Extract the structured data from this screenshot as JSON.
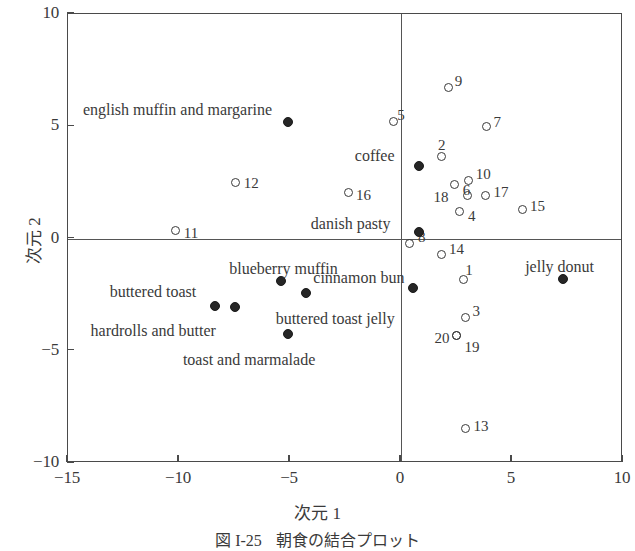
{
  "figure": {
    "caption_number": "図 I-25",
    "caption_text": "朝食の結合プロット"
  },
  "chart_data": {
    "type": "scatter",
    "title": "朝食の結合プロット",
    "xlabel": "次元 1",
    "ylabel": "次元 2",
    "xlim": [
      -15,
      10
    ],
    "ylim": [
      -10,
      10
    ],
    "xticks": [
      "-15",
      "-10",
      "-5",
      "0",
      "5",
      "10"
    ],
    "xtick_values": [
      -15,
      -10,
      -5,
      0,
      5,
      10
    ],
    "yticks": [
      "10",
      "5",
      "0",
      "-5",
      "-10"
    ],
    "ytick_values": [
      10,
      5,
      0,
      -5,
      -10
    ],
    "grid": false,
    "legend": "none",
    "series": [
      {
        "name": "attributes (open circles, numbered)",
        "marker": "open-circle",
        "points": [
          {
            "label": "9",
            "x": 2.2,
            "y": 6.7,
            "lx": 6,
            "ly": -13
          },
          {
            "label": "5",
            "x": -0.3,
            "y": 5.15,
            "lx": 4,
            "ly": -14
          },
          {
            "label": "7",
            "x": 3.9,
            "y": 4.95,
            "lx": 7,
            "ly": -11
          },
          {
            "label": "2",
            "x": 1.85,
            "y": 3.6,
            "lx": -3,
            "ly": -19
          },
          {
            "label": "10",
            "x": 3.1,
            "y": 2.55,
            "lx": 7,
            "ly": -13
          },
          {
            "label": "12",
            "x": -7.4,
            "y": 2.45,
            "lx": 8,
            "ly": -6
          },
          {
            "label": "16",
            "x": -2.3,
            "y": 2.0,
            "lx": 7,
            "ly": -5
          },
          {
            "label": "18",
            "x": 2.45,
            "y": 2.35,
            "lx": -21,
            "ly": 5
          },
          {
            "label": "17",
            "x": 3.85,
            "y": 1.85,
            "lx": 8,
            "ly": -11
          },
          {
            "label": "6",
            "x": 3.05,
            "y": 1.85,
            "lx": -5,
            "ly": -13
          },
          {
            "label": "15",
            "x": 5.5,
            "y": 1.25,
            "lx": 8,
            "ly": -10
          },
          {
            "label": "4",
            "x": 2.7,
            "y": 1.15,
            "lx": 8,
            "ly": -3
          },
          {
            "label": "11",
            "x": -10.1,
            "y": 0.3,
            "lx": 8,
            "ly": -5
          },
          {
            "label": "8",
            "x": 0.45,
            "y": -0.25,
            "lx": 8,
            "ly": -13
          },
          {
            "label": "14",
            "x": 1.85,
            "y": -0.75,
            "lx": 8,
            "ly": -12
          },
          {
            "label": "1",
            "x": 2.85,
            "y": -1.85,
            "lx": 2,
            "ly": -16
          },
          {
            "label": "3",
            "x": 2.95,
            "y": -3.55,
            "lx": 7,
            "ly": -13
          },
          {
            "label": "20",
            "x": 2.55,
            "y": -4.35,
            "lx": -22,
            "ly": -4
          },
          {
            "label": "19",
            "x": 2.55,
            "y": -4.35,
            "lx": 8,
            "ly": 5
          },
          {
            "label": "13",
            "x": 2.95,
            "y": -8.5,
            "lx": 8,
            "ly": -9
          }
        ]
      },
      {
        "name": "breakfast items (filled circles, named)",
        "marker": "filled-circle",
        "points": [
          {
            "label": "english muffin and margarine",
            "x": -5.05,
            "y": 5.15,
            "lx": -205,
            "ly": -20
          },
          {
            "label": "coffee",
            "x": 0.85,
            "y": 3.2,
            "lx": -64,
            "ly": -18
          },
          {
            "label": "danish pasty",
            "x": 0.85,
            "y": 0.25,
            "lx": -108,
            "ly": -16
          },
          {
            "label": "blueberry muffin",
            "x": -5.35,
            "y": -1.95,
            "lx": -52,
            "ly": -20
          },
          {
            "label": "buttered toast jelly",
            "x": -4.25,
            "y": -2.45,
            "lx": -30,
            "ly": 18
          },
          {
            "label": "buttered toast",
            "x": -8.35,
            "y": -3.05,
            "lx": -105,
            "ly": -22
          },
          {
            "label": "hardrolls and butter",
            "x": -7.45,
            "y": -3.1,
            "lx": -144,
            "ly": 16
          },
          {
            "label": "toast and marmalade",
            "x": -5.05,
            "y": -4.3,
            "lx": -105,
            "ly": 18
          },
          {
            "label": "cinnamon bun",
            "x": 0.6,
            "y": -2.25,
            "lx": -100,
            "ly": -18
          },
          {
            "label": "jelly donut",
            "x": 7.35,
            "y": -1.85,
            "lx": -38,
            "ly": -20
          }
        ]
      }
    ]
  }
}
